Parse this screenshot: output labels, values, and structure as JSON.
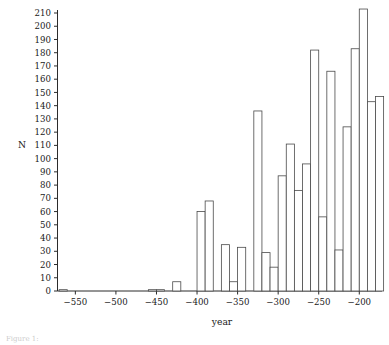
{
  "figure": {
    "kind": "histogram",
    "background_color": "#ffffff",
    "axis_color": "#2b2b2b",
    "bar_stroke_color": "#4a4a4a",
    "bar_fill_color": "#ffffff",
    "caption_fragment": "Figure 1:"
  },
  "chart_data": {
    "type": "bar",
    "title": "",
    "xlabel": "year",
    "ylabel": "N",
    "xlim": [
      -572,
      -172
    ],
    "ylim": [
      0,
      214
    ],
    "grid": false,
    "legend": null,
    "bin_width": 10,
    "xticks": [
      -550,
      -500,
      -450,
      -400,
      -350,
      -300,
      -250,
      -200
    ],
    "xtick_labels": [
      "−550",
      "−500",
      "−450",
      "−400",
      "−350",
      "−300",
      "−250",
      "−200"
    ],
    "yticks": [
      0,
      10,
      20,
      30,
      40,
      50,
      60,
      70,
      80,
      90,
      100,
      110,
      120,
      130,
      140,
      150,
      160,
      170,
      180,
      190,
      200,
      210
    ],
    "ytick_labels": [
      "0",
      "10",
      "20",
      "30",
      "40",
      "50",
      "60",
      "70",
      "80",
      "90",
      "100",
      "110",
      "120",
      "130",
      "140",
      "150",
      "160",
      "170",
      "180",
      "190",
      "200",
      "210"
    ],
    "categories": [
      -570,
      -560,
      -550,
      -540,
      -530,
      -520,
      -510,
      -500,
      -490,
      -480,
      -470,
      -460,
      -450,
      -440,
      -430,
      -420,
      -410,
      -400,
      -390,
      -380,
      -370,
      -360,
      -350,
      -340,
      -330,
      -320,
      -310,
      -300,
      -290,
      -280,
      -270,
      -260,
      -250,
      -240,
      -230,
      -220,
      -210,
      -200,
      -190,
      -180
    ],
    "bin_left_edges": [
      -570,
      -560,
      -550,
      -540,
      -530,
      -520,
      -510,
      -500,
      -490,
      -480,
      -470,
      -460,
      -450,
      -440,
      -430,
      -420,
      -410,
      -400,
      -390,
      -380,
      -370,
      -360,
      -350,
      -340,
      -330,
      -320,
      -310,
      -300,
      -290,
      -280,
      -270,
      -260,
      -250,
      -240,
      -230,
      -220,
      -210,
      -200,
      -190,
      -180
    ],
    "values": [
      1,
      0,
      0,
      0,
      0,
      0,
      0,
      0,
      0,
      0,
      0,
      1,
      1,
      0,
      7,
      0,
      0,
      60,
      68,
      0,
      35,
      7,
      33,
      0,
      136,
      29,
      18,
      87,
      111,
      76,
      96,
      182,
      56,
      166,
      31,
      124,
      183,
      213,
      143,
      147
    ]
  }
}
